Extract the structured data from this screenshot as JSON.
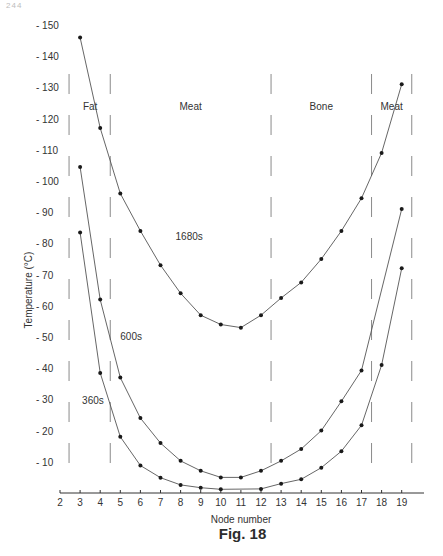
{
  "page": {
    "page_number": "244",
    "caption": "Fig. 18"
  },
  "chart_data": {
    "type": "line",
    "title": "",
    "xlabel": "Node number",
    "ylabel": "Temperature (°C)",
    "xlim": [
      2,
      20
    ],
    "ylim": [
      0,
      150
    ],
    "x_ticks": [
      2,
      3,
      4,
      5,
      6,
      7,
      8,
      9,
      10,
      11,
      12,
      13,
      14,
      15,
      16,
      17,
      18,
      19
    ],
    "y_ticks": [
      10,
      20,
      30,
      40,
      50,
      60,
      70,
      80,
      90,
      100,
      110,
      120,
      130,
      140,
      150
    ],
    "grid": false,
    "legend": "inline labels on curves",
    "regions": [
      {
        "label": "Fat",
        "from": 2.5,
        "to": 4.5
      },
      {
        "label": "Meat",
        "from": 4.5,
        "to": 12.5
      },
      {
        "label": "Bone",
        "from": 12.5,
        "to": 17.5
      },
      {
        "label": "Meat",
        "from": 17.5,
        "to": 19.5
      }
    ],
    "region_boundaries": [
      2.5,
      4.5,
      12.5,
      17.5,
      19.5
    ],
    "series": [
      {
        "name": "1680s",
        "label_pos": {
          "x": 7.75,
          "y": 81
        },
        "points": [
          [
            3,
            146
          ],
          [
            4,
            117
          ],
          [
            5,
            96
          ],
          [
            6,
            84
          ],
          [
            7,
            73
          ],
          [
            8,
            64
          ],
          [
            9,
            57
          ],
          [
            10,
            54
          ],
          [
            11,
            53
          ],
          [
            12,
            57
          ],
          [
            13,
            62.5
          ],
          [
            14,
            67.5
          ],
          [
            15,
            75
          ],
          [
            16,
            84
          ],
          [
            17,
            94.5
          ],
          [
            18,
            109
          ],
          [
            19,
            131
          ]
        ]
      },
      {
        "name": "600s",
        "label_pos": {
          "x": 5.0,
          "y": 49
        },
        "points": [
          [
            3,
            104.5
          ],
          [
            4,
            62
          ],
          [
            5,
            37
          ],
          [
            6,
            24
          ],
          [
            7,
            16
          ],
          [
            8,
            10.3
          ],
          [
            9,
            7.1
          ],
          [
            10,
            5
          ],
          [
            11,
            5
          ],
          [
            12,
            7.1
          ],
          [
            13,
            10.3
          ],
          [
            14,
            14.1
          ],
          [
            15,
            20
          ],
          [
            16,
            29.4
          ],
          [
            17,
            39.3
          ],
          [
            19,
            91
          ]
        ]
      },
      {
        "name": "360s",
        "label_pos": {
          "x": 3.1,
          "y": 28.5
        },
        "points": [
          [
            3,
            83.5
          ],
          [
            4,
            38.5
          ],
          [
            5,
            18
          ],
          [
            6,
            8.8
          ],
          [
            7,
            4.9
          ],
          [
            8,
            2.6
          ],
          [
            9,
            1.7
          ],
          [
            10,
            1.2
          ],
          [
            12,
            1.3
          ],
          [
            13,
            3
          ],
          [
            14,
            4.4
          ],
          [
            15,
            8.1
          ],
          [
            16,
            13.4
          ],
          [
            17,
            21.7
          ],
          [
            18,
            41
          ],
          [
            19,
            72
          ]
        ]
      }
    ]
  },
  "style": {
    "line_color": "#555555",
    "marker_color": "#1a1a1a",
    "axis_color": "#333333",
    "dash_color": "#8a8a8a",
    "text_color": "#333333"
  }
}
